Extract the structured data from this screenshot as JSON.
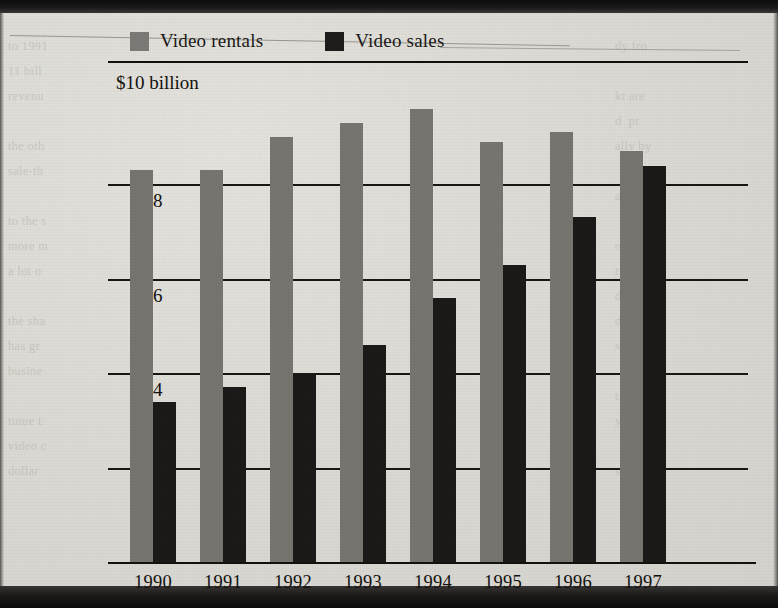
{
  "figure": {
    "unit_label": "$10 billion",
    "legend": [
      {
        "name": "legend-rentals",
        "label": "Video rentals",
        "color": "#77756f"
      },
      {
        "name": "legend-sales",
        "label": "Video sales",
        "color": "#1b1a19"
      }
    ],
    "bleed_text_left": "to 1991\n11 bill\nrevenu\n\nthe oth\nsale-th\n\nto the s\nmore m\na lot o\n\nthe sha\nhas gr\nbusine\n\ntinue t\nvideo c\ndollar",
    "bleed_text_right": "dy fro\n\nkt are\nd  pr\nally by\n\nape m\n\nowth\nrising\nd  rev\nd  for\nvideo\n\ntion o\nyear\n\ns  are"
  },
  "chart_data": {
    "type": "bar",
    "title": "",
    "subtitle": "",
    "xlabel": "",
    "ylabel": "$10 billion",
    "categories": [
      "1990",
      "1991",
      "1992",
      "1993",
      "1994",
      "1995",
      "1996",
      "1997"
    ],
    "series": [
      {
        "name": "Video rentals",
        "color": "#77756f",
        "values": [
          8.3,
          8.3,
          9.0,
          9.3,
          9.6,
          8.9,
          9.1,
          8.7
        ]
      },
      {
        "name": "Video sales",
        "color": "#1b1a19",
        "values": [
          3.4,
          3.7,
          4.0,
          4.6,
          5.6,
          6.3,
          7.3,
          8.4
        ]
      }
    ],
    "ylim": [
      0,
      10
    ],
    "yticks": [
      2,
      4,
      6,
      8
    ],
    "ytick_labels": [
      "2",
      "4",
      "6",
      "8"
    ],
    "grid": true,
    "legend_position": "top"
  }
}
